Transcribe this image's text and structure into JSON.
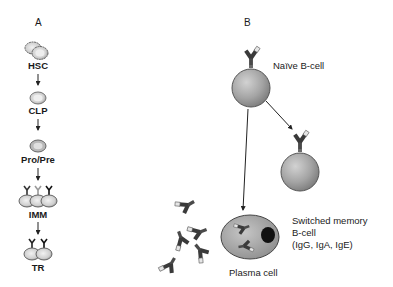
{
  "panels": {
    "a": {
      "label": "A"
    },
    "b": {
      "label": "B"
    }
  },
  "panel_a": {
    "title_hint": "B-cell development stages",
    "stages": [
      {
        "label": "HSC"
      },
      {
        "label": "CLP"
      },
      {
        "label": "Pro/Pre"
      },
      {
        "label": "IMM"
      },
      {
        "label": "TR"
      }
    ]
  },
  "panel_b": {
    "naive_cell": {
      "label": "Naïve B-cell"
    },
    "memory_cell": {
      "label_lines": [
        "Switched memory",
        "B-cell",
        "(IgG, IgA, IgE)"
      ]
    },
    "plasma_cell": {
      "label": "Plasma cell"
    },
    "free_antibody_count": 5
  },
  "colors": {
    "cell_fill": "#a9a9a9",
    "cell_edge": "#555555",
    "antibody_dark": "#3a3a3a",
    "antibody_light": "#e6e6e6",
    "text": "#1a1a1a"
  }
}
